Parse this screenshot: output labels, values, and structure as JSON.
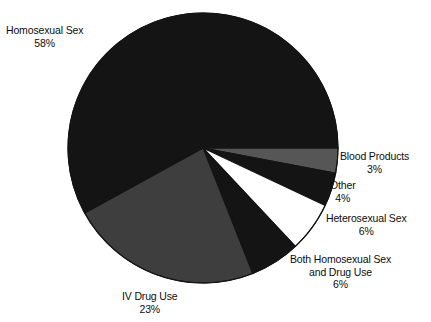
{
  "chart_data": {
    "type": "pie",
    "title": "",
    "subtitle": "",
    "xlabel": "",
    "ylabel": "",
    "legend_position": "none",
    "grid": false,
    "labels_outside": true,
    "start_angle_deg": 0,
    "direction": "clockwise",
    "center": {
      "cx": 203,
      "cy": 148,
      "r": 135
    },
    "categories": [
      "Blood Products",
      "Other",
      "Heterosexual Sex",
      "Both Homosexual Sex and Drug Use",
      "IV Drug Use",
      "Homosexual Sex"
    ],
    "values": [
      3,
      4,
      6,
      6,
      23,
      58
    ],
    "value_labels": [
      "3%",
      "4%",
      "6%",
      "6%",
      "23%",
      "58%"
    ],
    "slices": [
      {
        "name": "Blood Products",
        "label_lines": [
          "Blood Products",
          "3%"
        ],
        "value": 3,
        "value_label": "3%",
        "color": "#565656",
        "start_deg": 0,
        "end_deg": 10.8
      },
      {
        "name": "Other",
        "label_lines": [
          "Other",
          "4%"
        ],
        "value": 4,
        "value_label": "4%",
        "color": "#141414",
        "start_deg": 10.8,
        "end_deg": 25.2
      },
      {
        "name": "Heterosexual Sex",
        "label_lines": [
          "Heterosexual Sex",
          "6%"
        ],
        "value": 6,
        "value_label": "6%",
        "color": "#ffffff",
        "start_deg": 25.2,
        "end_deg": 46.8
      },
      {
        "name": "Both Homosexual Sex and Drug Use",
        "label_lines": [
          "Both Homosexual Sex",
          "and Drug Use",
          "6%"
        ],
        "value": 6,
        "value_label": "6%",
        "color": "#141414",
        "start_deg": 46.8,
        "end_deg": 68.4
      },
      {
        "name": "IV Drug Use",
        "label_lines": [
          "IV Drug Use",
          "23%"
        ],
        "value": 23,
        "value_label": "23%",
        "color": "#3e3e3e",
        "start_deg": 68.4,
        "end_deg": 151.2
      },
      {
        "name": "Homosexual Sex",
        "label_lines": [
          "Homosexual Sex",
          "58%"
        ],
        "value": 58,
        "value_label": "58%",
        "color": "#141414",
        "start_deg": 151.2,
        "end_deg": 360
      }
    ],
    "colors": {
      "black": "#141414",
      "dark_gray": "#3e3e3e",
      "mid_gray": "#565656",
      "white": "#ffffff",
      "outline": "#141414",
      "background": "#ffffff",
      "text": "#0d0d0d"
    }
  },
  "labels": {
    "homosexual_sex": {
      "line1": "Homosexual Sex",
      "line2": "58%"
    },
    "blood_products": {
      "line1": "Blood Products",
      "line2": "3%"
    },
    "other": {
      "line1": "Other",
      "line2": "4%"
    },
    "heterosexual_sex": {
      "line1": "Heterosexual Sex",
      "line2": "6%"
    },
    "both_homosexual_drug": {
      "line1": "Both Homosexual Sex",
      "line2": "and Drug Use",
      "line3": "6%"
    },
    "iv_drug_use": {
      "line1": "IV Drug Use",
      "line2": "23%"
    }
  }
}
